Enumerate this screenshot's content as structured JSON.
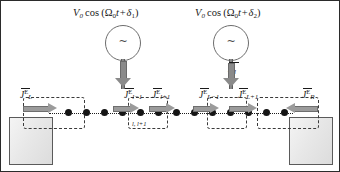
{
  "figure": {
    "name": "driven-lattice-chain-energy-current-diagram",
    "background_color": "#ffffff",
    "accent_color": "#9b9b9b",
    "dot_color": "#141414"
  },
  "drives": [
    {
      "id": "drive-1",
      "label_prefix": "V",
      "label_prefix_sub": "0",
      "label_cos": "cos",
      "label_open": "(",
      "label_omega": "Ω",
      "label_omega_sub": "0",
      "label_t": "t",
      "label_plus": "+",
      "label_delta": "δ",
      "label_delta_sub": "1",
      "label_close": ")",
      "symbol": "~"
    },
    {
      "id": "drive-2",
      "label_prefix": "V",
      "label_prefix_sub": "0",
      "label_cos": "cos",
      "label_open": "(",
      "label_omega": "Ω",
      "label_omega_sub": "0",
      "label_t": "t",
      "label_plus": "+",
      "label_delta": "δ",
      "label_delta_sub": "2",
      "label_close": ")",
      "symbol": "~"
    }
  ],
  "power_label": {
    "symbol": "P",
    "subscript": "l"
  },
  "currents": [
    {
      "id": "J-L",
      "symbol": "J",
      "subscript": "L",
      "superscript": "E",
      "direction": "right"
    },
    {
      "id": "J-l-1",
      "symbol": "J",
      "subscript": "l−1",
      "superscript": "E",
      "direction": "right"
    },
    {
      "id": "J-l+1",
      "symbol": "J",
      "subscript": "l+1",
      "superscript": "E",
      "direction": "right"
    },
    {
      "id": "J-L-1",
      "symbol": "J",
      "subscript": "L−1",
      "superscript": "E",
      "direction": "right"
    },
    {
      "id": "J-L+1",
      "symbol": "J",
      "subscript": "L+1",
      "superscript": "E",
      "direction": "right"
    },
    {
      "id": "J-R",
      "symbol": "J",
      "subscript": "R",
      "superscript": "E",
      "direction": "left"
    }
  ],
  "cell_label": {
    "text": "l,  l+1"
  },
  "lattice": {
    "site_count": 13,
    "site_label": "lattice-site"
  },
  "reservoirs": [
    {
      "id": "reservoir-left",
      "name": "left-thermal-reservoir"
    },
    {
      "id": "reservoir-right",
      "name": "right-thermal-reservoir"
    }
  ]
}
